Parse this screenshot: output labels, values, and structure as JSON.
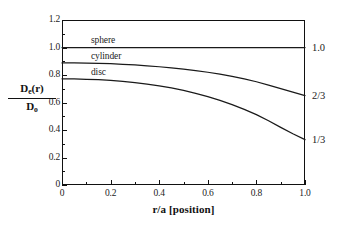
{
  "chart_data": {
    "type": "line",
    "title": "",
    "xlabel": "r/a [position]",
    "ylabel_numerator": "D",
    "ylabel_numerator_sub": "e",
    "ylabel_numerator_tail": "(r)",
    "ylabel_denominator": "D",
    "ylabel_denominator_sub": "o",
    "ylabel_plain": "De(r)/Do",
    "xlim": [
      0,
      1.0
    ],
    "ylim": [
      0,
      1.2
    ],
    "grid": false,
    "legend_position": "inline-curve-labels",
    "x_ticks": [
      "0",
      "0.2",
      "0.4",
      "0.6",
      "0.8",
      "1.0"
    ],
    "x_tick_values": [
      0,
      0.2,
      0.4,
      0.6,
      0.8,
      1.0
    ],
    "y_ticks": [
      "0",
      "0.2",
      "0.4",
      "0.6",
      "0.8",
      "1.0",
      "1.2"
    ],
    "y_tick_values": [
      0,
      0.2,
      0.4,
      0.6,
      0.8,
      1.0,
      1.2
    ],
    "x": [
      0,
      0.05,
      0.1,
      0.15,
      0.2,
      0.25,
      0.3,
      0.35,
      0.4,
      0.45,
      0.5,
      0.55,
      0.6,
      0.65,
      0.7,
      0.75,
      0.8,
      0.85,
      0.9,
      0.95,
      1.0
    ],
    "series": [
      {
        "name": "sphere",
        "label": "sphere",
        "end_annotation": "1.0",
        "values": [
          1.0,
          1.0,
          1.0,
          1.0,
          1.0,
          1.0,
          1.0,
          1.0,
          1.0,
          1.0,
          1.0,
          1.0,
          1.0,
          1.0,
          1.0,
          1.0,
          1.0,
          1.0,
          1.0,
          1.0,
          1.0
        ]
      },
      {
        "name": "cylinder",
        "label": "cylinder",
        "end_annotation": "2/3",
        "values": [
          0.888,
          0.888,
          0.887,
          0.885,
          0.882,
          0.878,
          0.873,
          0.867,
          0.86,
          0.852,
          0.843,
          0.832,
          0.82,
          0.806,
          0.79,
          0.772,
          0.751,
          0.727,
          0.701,
          0.675,
          0.65
        ]
      },
      {
        "name": "disc",
        "label": "disc",
        "end_annotation": "1/3",
        "values": [
          0.772,
          0.771,
          0.769,
          0.766,
          0.761,
          0.754,
          0.745,
          0.734,
          0.721,
          0.706,
          0.688,
          0.667,
          0.643,
          0.616,
          0.585,
          0.55,
          0.512,
          0.467,
          0.419,
          0.373,
          0.33
        ]
      }
    ],
    "right_axis_annotations": [
      {
        "text": "1.0",
        "value": 1.0
      },
      {
        "text": "2/3",
        "value": 0.65
      },
      {
        "text": "1/3",
        "value": 0.33
      }
    ],
    "colors": {
      "curve": "#1a1a1a",
      "axis": "#111111",
      "background": "#ffffff"
    }
  }
}
